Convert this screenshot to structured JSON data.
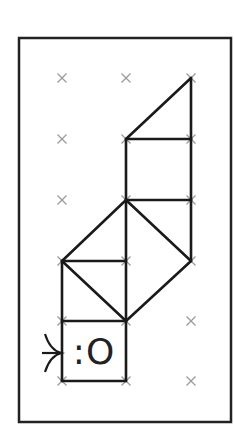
{
  "diagram": {
    "type": "grid-puzzle",
    "frame": {
      "x1": 19,
      "y1": 38,
      "x2": 231,
      "y2": 422,
      "stroke": "#222222"
    },
    "grid": {
      "columns_x": [
        62,
        126,
        191
      ],
      "rows_y": [
        78,
        139,
        200,
        261,
        321,
        381
      ],
      "marker": "x",
      "marker_color": "#9a9a9a"
    },
    "segments": [
      [
        191,
        78,
        126,
        139
      ],
      [
        191,
        78,
        191,
        139
      ],
      [
        126,
        139,
        191,
        139
      ],
      [
        126,
        139,
        126,
        200
      ],
      [
        191,
        139,
        191,
        200
      ],
      [
        126,
        200,
        191,
        200
      ],
      [
        126,
        200,
        62,
        261
      ],
      [
        126,
        200,
        191,
        261
      ],
      [
        191,
        200,
        191,
        261
      ],
      [
        126,
        200,
        126,
        321
      ],
      [
        62,
        261,
        126,
        261
      ],
      [
        62,
        261,
        126,
        321
      ],
      [
        191,
        261,
        126,
        321
      ],
      [
        62,
        261,
        62,
        381
      ],
      [
        62,
        321,
        126,
        321
      ],
      [
        126,
        321,
        126,
        381
      ],
      [
        62,
        381,
        126,
        381
      ]
    ],
    "line_color": "#1a1a1a",
    "face_label": ":O",
    "entry_arrow": {
      "tip_x": 62,
      "tip_y": 353,
      "direction": "right"
    }
  }
}
